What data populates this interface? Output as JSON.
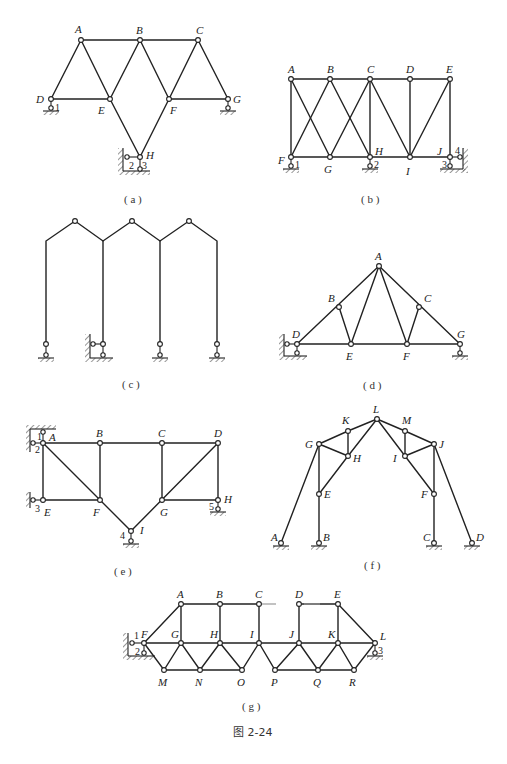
{
  "figure_caption": "图 2-24",
  "subfigures": [
    {
      "id": "a",
      "caption": "( a )",
      "nodes": [
        "A",
        "B",
        "C",
        "D",
        "E",
        "F",
        "G",
        "H"
      ],
      "support_labels": [
        "1",
        "2",
        "3"
      ]
    },
    {
      "id": "b",
      "caption": "( b )",
      "nodes": [
        "A",
        "B",
        "C",
        "D",
        "E",
        "F",
        "G",
        "H",
        "I",
        "J"
      ],
      "support_labels": [
        "1",
        "2",
        "3",
        "4"
      ]
    },
    {
      "id": "c",
      "caption": "( c )",
      "nodes": [],
      "support_labels": []
    },
    {
      "id": "d",
      "caption": "( d )",
      "nodes": [
        "A",
        "B",
        "C",
        "D",
        "E",
        "F",
        "G"
      ],
      "support_labels": []
    },
    {
      "id": "e",
      "caption": "( e )",
      "nodes": [
        "A",
        "B",
        "C",
        "D",
        "E",
        "F",
        "G",
        "H",
        "I"
      ],
      "support_labels": [
        "1",
        "2",
        "3",
        "4",
        "5"
      ]
    },
    {
      "id": "f",
      "caption": "( f )",
      "nodes": [
        "A",
        "B",
        "C",
        "D",
        "E",
        "F",
        "G",
        "H",
        "I",
        "J",
        "K",
        "L",
        "M"
      ],
      "support_labels": []
    },
    {
      "id": "g",
      "caption": "( g )",
      "nodes": [
        "A",
        "B",
        "C",
        "D",
        "E",
        "F",
        "G",
        "H",
        "I",
        "J",
        "K",
        "L",
        "M",
        "N",
        "O",
        "P",
        "Q",
        "R"
      ],
      "support_labels": [
        "1",
        "2",
        "3"
      ]
    }
  ],
  "labels": {
    "a": {
      "A": "A",
      "B": "B",
      "C": "C",
      "D": "D",
      "E": "E",
      "F": "F",
      "G": "G",
      "H": "H",
      "s1": "1",
      "s2": "2",
      "s3": "3",
      "cap": "( a )"
    },
    "b": {
      "A": "A",
      "B": "B",
      "C": "C",
      "D": "D",
      "E": "E",
      "F": "F",
      "G": "G",
      "H": "H",
      "I": "I",
      "J": "J",
      "s1": "1",
      "s2": "2",
      "s3": "3",
      "s4": "4",
      "cap": "( b )"
    },
    "c": {
      "cap": "( c )"
    },
    "d": {
      "A": "A",
      "B": "B",
      "C": "C",
      "D": "D",
      "E": "E",
      "F": "F",
      "G": "G",
      "cap": "( d )"
    },
    "e": {
      "A": "A",
      "B": "B",
      "C": "C",
      "D": "D",
      "E": "E",
      "F": "F",
      "G": "G",
      "H": "H",
      "I": "I",
      "s1": "1",
      "s2": "2",
      "s3": "3",
      "s4": "4",
      "s5": "5",
      "cap": "( e )"
    },
    "f": {
      "A": "A",
      "B": "B",
      "C": "C",
      "D": "D",
      "E": "E",
      "F": "F",
      "G": "G",
      "H": "H",
      "I": "I",
      "J": "J",
      "K": "K",
      "L": "L",
      "M": "M",
      "cap": "( f )"
    },
    "g": {
      "A": "A",
      "B": "B",
      "C": "C",
      "D": "D",
      "E": "E",
      "F": "F",
      "G": "G",
      "H": "H",
      "I": "I",
      "J": "J",
      "K": "K",
      "L": "L",
      "M": "M",
      "N": "N",
      "O": "O",
      "P": "P",
      "Q": "Q",
      "R": "R",
      "s1": "1",
      "s2": "2",
      "s3": "3",
      "cap": "( g )"
    }
  }
}
